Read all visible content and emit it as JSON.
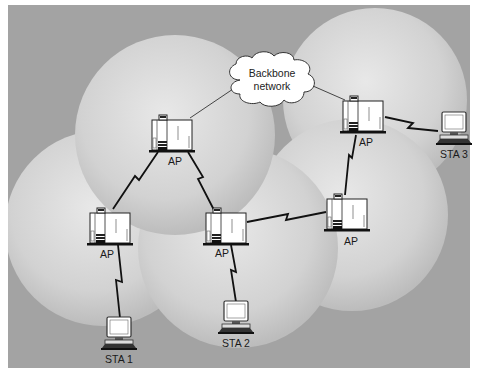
{
  "diagram": {
    "type": "wireless-distribution-system",
    "colors": {
      "background": "#a3a3a3",
      "cell_center": "#e6e6e6",
      "cell_edge": "#bdbdbd",
      "device_fill": "#ffffff",
      "line": "#111111"
    },
    "backbone": {
      "label_line1": "Backbone",
      "label_line2": "network"
    },
    "access_points": [
      {
        "id": "ap-top",
        "label": "AP"
      },
      {
        "id": "ap-top-right",
        "label": "AP"
      },
      {
        "id": "ap-left",
        "label": "AP"
      },
      {
        "id": "ap-center",
        "label": "AP"
      },
      {
        "id": "ap-right",
        "label": "AP"
      }
    ],
    "stations": [
      {
        "id": "sta-1",
        "label": "STA 1"
      },
      {
        "id": "sta-2",
        "label": "STA 2"
      },
      {
        "id": "sta-3",
        "label": "STA 3"
      }
    ],
    "links": [
      {
        "from": "backbone",
        "to": "ap-top",
        "kind": "wired"
      },
      {
        "from": "backbone",
        "to": "ap-top-right",
        "kind": "wired"
      },
      {
        "from": "ap-top",
        "to": "ap-left",
        "kind": "wireless"
      },
      {
        "from": "ap-top",
        "to": "ap-center",
        "kind": "wireless"
      },
      {
        "from": "ap-center",
        "to": "ap-right",
        "kind": "wireless"
      },
      {
        "from": "ap-right",
        "to": "ap-top-right",
        "kind": "wireless"
      },
      {
        "from": "ap-top-right",
        "to": "sta-3",
        "kind": "wireless"
      },
      {
        "from": "ap-left",
        "to": "sta-1",
        "kind": "wireless"
      },
      {
        "from": "ap-center",
        "to": "sta-2",
        "kind": "wireless"
      }
    ]
  }
}
